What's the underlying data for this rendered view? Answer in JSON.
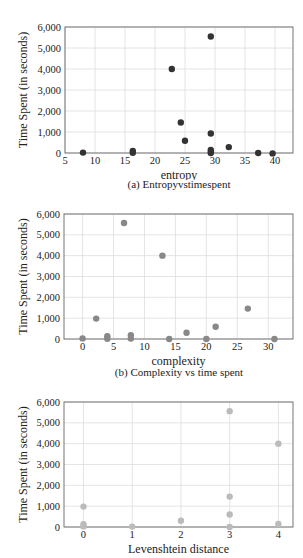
{
  "chart_data": [
    {
      "id": "a",
      "type": "scatter",
      "title": "(a) Entropyvstimespent",
      "xlabel": "entropy",
      "ylabel": "Time Spent (in seconds)",
      "xlim": [
        5,
        43
      ],
      "ylim": [
        0,
        6000
      ],
      "xticks": [
        5,
        10,
        15,
        20,
        25,
        30,
        35,
        40
      ],
      "yticks": [
        0,
        1000,
        2000,
        3000,
        4000,
        5000,
        6000
      ],
      "ytick_labels": [
        "0",
        "1,000",
        "2,000",
        "3,000",
        "4,000",
        "5,000",
        "6,000"
      ],
      "grid": true,
      "color": "#333333",
      "points": [
        {
          "x": 8,
          "y": 20
        },
        {
          "x": 16.3,
          "y": 100
        },
        {
          "x": 16.3,
          "y": 10
        },
        {
          "x": 22.8,
          "y": 4000
        },
        {
          "x": 24.3,
          "y": 1450
        },
        {
          "x": 25,
          "y": 580
        },
        {
          "x": 29.3,
          "y": 5550
        },
        {
          "x": 29.3,
          "y": 930
        },
        {
          "x": 29.3,
          "y": 150
        },
        {
          "x": 29.3,
          "y": 50
        },
        {
          "x": 29.3,
          "y": 0
        },
        {
          "x": 32.3,
          "y": 280
        },
        {
          "x": 37.2,
          "y": 0
        },
        {
          "x": 39.6,
          "y": -20
        }
      ]
    },
    {
      "id": "b",
      "type": "scatter",
      "title": "(b) Complexity vs time spent",
      "xlabel": "complexity",
      "ylabel": "Time Spent (in seconds)",
      "xlim": [
        -3,
        34
      ],
      "ylim": [
        0,
        6000
      ],
      "xticks": [
        0,
        5,
        10,
        15,
        20,
        25,
        30
      ],
      "yticks": [
        0,
        1000,
        2000,
        3000,
        4000,
        5000,
        6000
      ],
      "ytick_labels": [
        "0",
        "1,000",
        "2,000",
        "3,000",
        "4,000",
        "5,000",
        "6,000"
      ],
      "grid": true,
      "color": "#888888",
      "points": [
        {
          "x": 0,
          "y": 30
        },
        {
          "x": 2.2,
          "y": 980
        },
        {
          "x": 4,
          "y": 130
        },
        {
          "x": 4,
          "y": 10
        },
        {
          "x": 6.7,
          "y": 5570
        },
        {
          "x": 7.8,
          "y": 180
        },
        {
          "x": 7.8,
          "y": 20
        },
        {
          "x": 12.9,
          "y": 4000
        },
        {
          "x": 14,
          "y": 0
        },
        {
          "x": 16.8,
          "y": 300
        },
        {
          "x": 20,
          "y": 0
        },
        {
          "x": 21.5,
          "y": 590
        },
        {
          "x": 26.7,
          "y": 1460
        },
        {
          "x": 31,
          "y": 0
        }
      ]
    },
    {
      "id": "c",
      "type": "scatter",
      "title": "",
      "xlabel": "Levenshtein distance",
      "ylabel": "Time Spent (in seconds)",
      "xlim": [
        -0.4,
        4.3
      ],
      "ylim": [
        0,
        6000
      ],
      "xticks": [
        0,
        1,
        2,
        3,
        4
      ],
      "yticks": [
        0,
        1000,
        2000,
        3000,
        4000,
        5000,
        6000
      ],
      "ytick_labels": [
        "0",
        "1,000",
        "2,000",
        "3,000",
        "4,000",
        "5,000",
        "6,000"
      ],
      "grid": true,
      "color": "#bbbbbb",
      "points": [
        {
          "x": 0,
          "y": 980
        },
        {
          "x": 0,
          "y": 130
        },
        {
          "x": 0,
          "y": 30
        },
        {
          "x": 1,
          "y": 20
        },
        {
          "x": 2,
          "y": 300
        },
        {
          "x": 3,
          "y": 5560
        },
        {
          "x": 3,
          "y": 1460
        },
        {
          "x": 3,
          "y": 600
        },
        {
          "x": 3,
          "y": 0
        },
        {
          "x": 4,
          "y": 4000
        },
        {
          "x": 4,
          "y": 150
        }
      ]
    }
  ],
  "layout": [
    {
      "left": 65,
      "top": 27,
      "right": 293,
      "bottom": 153
    },
    {
      "left": 64,
      "top": 214,
      "right": 293,
      "bottom": 339
    },
    {
      "left": 64,
      "top": 402,
      "right": 293,
      "bottom": 527
    }
  ]
}
